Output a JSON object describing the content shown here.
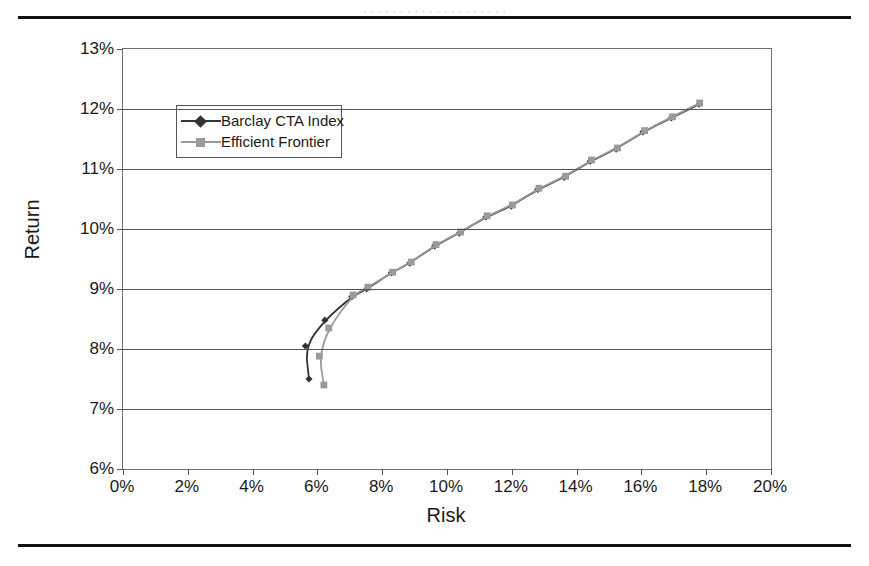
{
  "figure": {
    "caption_sliver": "· · · · · · · · · · · · · · · · · · · ·"
  },
  "chart_data": {
    "type": "scatter",
    "title": "",
    "xlabel": "Risk",
    "ylabel": "Return",
    "xlim": [
      0,
      20
    ],
    "ylim": [
      6,
      13
    ],
    "xtick_labels": [
      "0%",
      "2%",
      "4%",
      "6%",
      "8%",
      "10%",
      "12%",
      "14%",
      "16%",
      "18%",
      "20%"
    ],
    "xticks": [
      0,
      2,
      4,
      6,
      8,
      10,
      12,
      14,
      16,
      18,
      20
    ],
    "ytick_labels": [
      "6%",
      "7%",
      "8%",
      "9%",
      "10%",
      "11%",
      "12%",
      "13%"
    ],
    "yticks": [
      6,
      7,
      8,
      9,
      10,
      11,
      12,
      13
    ],
    "grid": "horizontal",
    "legend_position": "upper-left-inside",
    "series": [
      {
        "name": "Barclay CTA Index",
        "marker": "diamond",
        "color": "#333333",
        "points": [
          [
            5.74,
            7.5
          ],
          [
            5.63,
            8.05
          ],
          [
            6.23,
            8.48
          ],
          [
            7.06,
            8.87
          ],
          [
            7.52,
            9.0
          ],
          [
            8.28,
            9.27
          ],
          [
            8.85,
            9.43
          ],
          [
            9.62,
            9.72
          ],
          [
            10.38,
            9.93
          ],
          [
            11.2,
            10.2
          ],
          [
            11.98,
            10.38
          ],
          [
            12.8,
            10.66
          ],
          [
            13.62,
            10.86
          ],
          [
            14.42,
            11.13
          ],
          [
            15.22,
            11.33
          ],
          [
            16.05,
            11.62
          ],
          [
            16.92,
            11.85
          ],
          [
            17.78,
            12.08
          ]
        ]
      },
      {
        "name": "Efficient Frontier",
        "marker": "square",
        "color": "#9a9a9a",
        "points": [
          [
            6.2,
            7.4
          ],
          [
            6.06,
            7.88
          ],
          [
            6.35,
            8.35
          ],
          [
            7.1,
            8.9
          ],
          [
            7.56,
            9.03
          ],
          [
            8.32,
            9.28
          ],
          [
            8.9,
            9.45
          ],
          [
            9.66,
            9.74
          ],
          [
            10.42,
            9.95
          ],
          [
            11.24,
            10.22
          ],
          [
            12.02,
            10.4
          ],
          [
            12.84,
            10.68
          ],
          [
            13.66,
            10.88
          ],
          [
            14.46,
            11.15
          ],
          [
            15.26,
            11.35
          ],
          [
            16.1,
            11.64
          ],
          [
            16.96,
            11.87
          ],
          [
            17.8,
            12.1
          ]
        ]
      }
    ]
  },
  "legend": {
    "entries": [
      {
        "label": "Barclay CTA Index",
        "color": "#333333",
        "marker": "diamond"
      },
      {
        "label": "Efficient Frontier",
        "color": "#9a9a9a",
        "marker": "square"
      }
    ]
  }
}
